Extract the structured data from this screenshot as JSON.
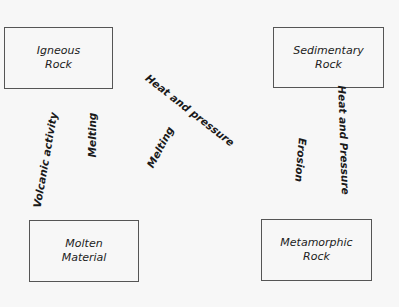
{
  "diagram": {
    "title": "",
    "nodes": [
      {
        "id": "igneous",
        "line1": "Igneous",
        "line2": "Rock"
      },
      {
        "id": "sedimentary",
        "line1": "Sedimentary",
        "line2": "Rock"
      },
      {
        "id": "molten",
        "line1": "Molten",
        "line2": "Material"
      },
      {
        "id": "metamorphic",
        "line1": "Metamorphic",
        "line2": "Rock"
      }
    ],
    "edges": [
      {
        "label": "Volcanic activity",
        "from": "molten",
        "to": "igneous"
      },
      {
        "label": "Melting",
        "from": "igneous",
        "to": "molten"
      },
      {
        "label": "Melting",
        "from": "metamorphic",
        "to": "molten"
      },
      {
        "label": "Heat and pressure",
        "from": "igneous",
        "to": "metamorphic"
      },
      {
        "label": "Erosion",
        "from": "metamorphic",
        "to": "sedimentary"
      },
      {
        "label": "Heat and Pressure",
        "from": "sedimentary",
        "to": "metamorphic"
      }
    ]
  }
}
